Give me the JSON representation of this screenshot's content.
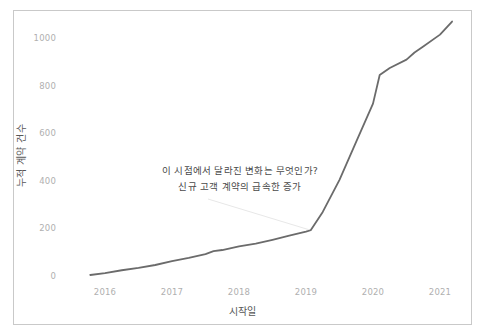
{
  "chart_data": {
    "type": "line",
    "title": "",
    "xlabel": "시작일",
    "ylabel": "누적 계약 건수",
    "xlim": [
      2015.75,
      2021.2
    ],
    "ylim": [
      0,
      1100
    ],
    "grid": false,
    "legend": null,
    "x_ticks": [
      "2016",
      "2017",
      "2018",
      "2019",
      "2020",
      "2021"
    ],
    "x_tick_values": [
      2016,
      2017,
      2018,
      2019,
      2020,
      2021
    ],
    "y_ticks": [
      "0",
      "200",
      "400",
      "600",
      "800",
      "1000"
    ],
    "y_tick_values": [
      0,
      200,
      400,
      600,
      800,
      1000
    ],
    "series": [
      {
        "name": "누적 계약 건수",
        "color": "#6b6b6b",
        "x": [
          2015.78,
          2016.0,
          2016.25,
          2016.5,
          2016.75,
          2017.0,
          2017.25,
          2017.5,
          2017.62,
          2017.75,
          2018.0,
          2018.25,
          2018.5,
          2018.75,
          2019.0,
          2019.07,
          2019.25,
          2019.5,
          2019.75,
          2020.0,
          2020.1,
          2020.25,
          2020.5,
          2020.62,
          2020.75,
          2021.0,
          2021.18
        ],
        "y": [
          0,
          8,
          20,
          30,
          42,
          58,
          72,
          88,
          100,
          105,
          120,
          132,
          148,
          165,
          182,
          188,
          265,
          400,
          560,
          720,
          840,
          870,
          905,
          935,
          960,
          1010,
          1065
        ]
      }
    ],
    "annotations": [
      {
        "name": "inflection-callout",
        "lines": [
          "이 시점에서 달라진 변화는 무엇인가?",
          "신규 고객 계약의 급속한 증가"
        ],
        "target_x": 2019.07,
        "target_y": 188
      }
    ]
  },
  "axes": {
    "x_title": "시작일",
    "y_title": "누적 계약 건수",
    "x_tick_labels": [
      "2016",
      "2017",
      "2018",
      "2019",
      "2020",
      "2021"
    ],
    "y_tick_labels": [
      "0",
      "200",
      "400",
      "600",
      "800",
      "1000"
    ]
  },
  "annotation": {
    "line1": "이 시점에서 달라진 변화는 무엇인가?",
    "line2": "신규 고객 계약의 급속한 증가"
  },
  "colors": {
    "line": "#6b6b6b",
    "frame": "#c9c9c9",
    "tick_text": "#b0b0b0",
    "title_text": "#575757",
    "annotation_text": "#4a4a4a",
    "leader_line": "#e3e3e3",
    "background": "#ffffff"
  }
}
